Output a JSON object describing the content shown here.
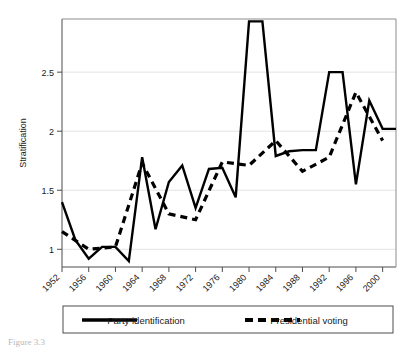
{
  "chart_data": {
    "type": "line",
    "title": "",
    "xlabel": "",
    "ylabel": "Stratification",
    "xlim": [
      1952,
      2002
    ],
    "ylim": [
      0.85,
      2.95
    ],
    "grid": true,
    "grid_axis": "y",
    "legend_position": "bottom",
    "x_tick_labels": [
      "1952",
      "1956",
      "1960",
      "1964",
      "1968",
      "1972",
      "1976",
      "1980",
      "1984",
      "1988",
      "1992",
      "1996",
      "2000"
    ],
    "x_tick_values": [
      1952,
      1956,
      1960,
      1964,
      1968,
      1972,
      1976,
      1980,
      1984,
      1988,
      1992,
      1996,
      2000
    ],
    "y_tick_labels": [
      "1",
      "1.5",
      "2",
      "2.5"
    ],
    "y_tick_values": [
      1,
      1.5,
      2,
      2.5
    ],
    "series": [
      {
        "name": "Party identification",
        "style": "solid",
        "color": "#000000",
        "x": [
          1952,
          1954,
          1956,
          1958,
          1960,
          1962,
          1964,
          1966,
          1968,
          1970,
          1972,
          1974,
          1976,
          1978,
          1980,
          1982,
          1984,
          1986,
          1988,
          1990,
          1992,
          1994,
          1996,
          1998,
          2000,
          2002
        ],
        "values": [
          1.4,
          1.08,
          0.92,
          1.02,
          1.02,
          0.9,
          1.78,
          1.17,
          1.57,
          1.71,
          1.35,
          1.68,
          1.69,
          1.44,
          2.93,
          2.93,
          1.79,
          1.83,
          1.84,
          1.84,
          2.5,
          2.5,
          1.55,
          2.26,
          2.02,
          2.02
        ]
      },
      {
        "name": "Presidential voting",
        "style": "dashed",
        "color": "#000000",
        "x": [
          1952,
          1956,
          1960,
          1964,
          1968,
          1972,
          1976,
          1980,
          1984,
          1988,
          1992,
          1996,
          2000
        ],
        "values": [
          1.15,
          1.0,
          1.02,
          1.73,
          1.3,
          1.25,
          1.74,
          1.71,
          1.92,
          1.66,
          1.78,
          2.33,
          1.92
        ]
      }
    ]
  },
  "legend": {
    "entries": [
      {
        "label": "Party identification",
        "style": "solid"
      },
      {
        "label": "Presidential voting",
        "style": "dashed"
      }
    ]
  },
  "caption": {
    "text": "Figure 3.3"
  }
}
